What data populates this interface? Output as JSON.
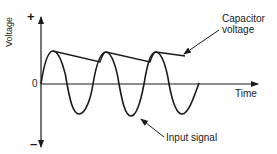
{
  "diagram": {
    "y_axis": {
      "label": "Voltage",
      "positive_symbol": "+",
      "negative_symbol": "–",
      "zero_label": "0"
    },
    "x_axis": {
      "label": "Time"
    },
    "annotations": {
      "capacitor_line1": "Capacitor",
      "capacitor_line2": "voltage",
      "input_signal": "Input signal"
    },
    "colors": {
      "stroke": "#1a1a1a",
      "background": "#ffffff"
    }
  }
}
